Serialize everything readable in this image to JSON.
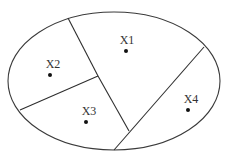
{
  "diagram": {
    "type": "partitioned-ellipse",
    "region_count": 4,
    "ellipse": {
      "cx": 114,
      "cy": 81,
      "rx": 106,
      "ry": 69
    },
    "regions": [
      {
        "id": "X1",
        "label": "X1",
        "point": [
          126,
          51
        ],
        "label_pos": [
          127,
          44
        ]
      },
      {
        "id": "X2",
        "label": "X2",
        "point": [
          50,
          75
        ],
        "label_pos": [
          53,
          68
        ]
      },
      {
        "id": "X3",
        "label": "X3",
        "point": [
          86,
          122
        ],
        "label_pos": [
          89,
          115
        ]
      },
      {
        "id": "X4",
        "label": "X4",
        "point": [
          188,
          110
        ],
        "label_pos": [
          191,
          103
        ]
      }
    ],
    "dividers": [
      {
        "name": "x1-left-boundary",
        "from": [
          68,
          18
        ],
        "to": [
          98,
          76
        ]
      },
      {
        "name": "x1-x3-boundary",
        "from": [
          98,
          76
        ],
        "to": [
          129,
          131
        ]
      },
      {
        "name": "x2-x3-boundary",
        "from": [
          98,
          76
        ],
        "to": [
          20,
          110
        ]
      },
      {
        "name": "x1-x4-boundary",
        "from": [
          204,
          47
        ],
        "to": [
          114,
          150
        ]
      }
    ],
    "colors": {
      "stroke": "#333333",
      "point": "#111111",
      "background": "#ffffff"
    }
  }
}
